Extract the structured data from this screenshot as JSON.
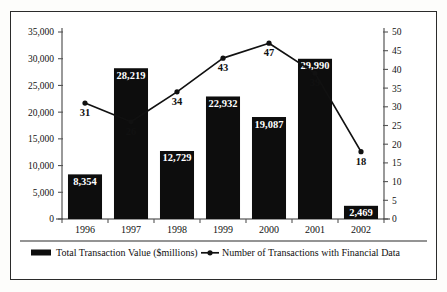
{
  "chart_data": {
    "type": "bar",
    "title": "",
    "subtitle": "",
    "xlabel": "",
    "ylabel": "",
    "categories": [
      "1996",
      "1997",
      "1998",
      "1999",
      "2000",
      "2001",
      "2002"
    ],
    "grid": false,
    "legend_position": "bottom",
    "axes": {
      "left": {
        "label": "",
        "min": 0,
        "max": 35000,
        "step": 5000,
        "ticks": [
          "0",
          "5,000",
          "10,000",
          "15,000",
          "20,000",
          "25,000",
          "30,000",
          "35,000"
        ],
        "tick_values": [
          0,
          5000,
          10000,
          15000,
          20000,
          25000,
          30000,
          35000
        ]
      },
      "right": {
        "label": "",
        "min": 0,
        "max": 50,
        "step": 5,
        "ticks": [
          "0",
          "5",
          "10",
          "15",
          "20",
          "25",
          "30",
          "35",
          "40",
          "45",
          "50"
        ],
        "tick_values": [
          0,
          5,
          10,
          15,
          20,
          25,
          30,
          35,
          40,
          45,
          50
        ]
      }
    },
    "series": [
      {
        "name": "Total Transaction Value ($millions)",
        "kind": "bar",
        "axis": "left",
        "color": "#0d0d0d",
        "values": [
          8354,
          28219,
          12729,
          22932,
          19087,
          29990,
          2469
        ],
        "data_labels": [
          "8,354",
          "28,219",
          "12,729",
          "22,932",
          "19,087",
          "29,990",
          "2,469"
        ]
      },
      {
        "name": "Number of Transactions with Financial Data",
        "kind": "line",
        "axis": "right",
        "color": "#111111",
        "values": [
          31,
          26,
          34,
          43,
          47,
          39,
          18
        ],
        "data_labels": [
          "31",
          "26",
          "34",
          "43",
          "47",
          "39",
          "18"
        ]
      }
    ]
  },
  "legend": {
    "items": [
      {
        "label": "Total Transaction Value ($millions)",
        "marker": "swatch-rect",
        "color": "#0d0d0d"
      },
      {
        "label": "Number of Transactions with Financial Data",
        "marker": "line-with-point",
        "color": "#111111"
      }
    ]
  }
}
